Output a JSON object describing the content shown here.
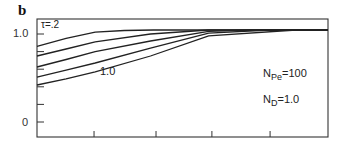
{
  "chart_data": {
    "type": "line",
    "panel_label": "b",
    "title": "",
    "xlabel": "",
    "ylabel": "",
    "ylim": [
      0,
      1.1
    ],
    "xlim": [
      0,
      1
    ],
    "y_ticks": [
      {
        "value": 1.0,
        "label": "1.0"
      },
      {
        "value": 0.8,
        "label": ""
      },
      {
        "value": 0.6,
        "label": ""
      },
      {
        "value": 0.4,
        "label": ""
      },
      {
        "value": 0.2,
        "label": ""
      },
      {
        "value": 0.0,
        "label": "0"
      }
    ],
    "x_ticks": [
      0.196,
      0.409,
      0.601,
      0.801
    ],
    "grid": false,
    "plateau_value": 1.045,
    "series": [
      {
        "name": "τ=.2",
        "x": [
          0,
          0.1,
          0.2,
          0.3,
          0.4,
          1.0
        ],
        "y": [
          0.86,
          0.95,
          1.02,
          1.04,
          1.045,
          1.045
        ]
      },
      {
        "name": "τ (2)",
        "x": [
          0,
          0.1,
          0.2,
          0.39,
          0.59,
          1.0
        ],
        "y": [
          0.75,
          0.83,
          0.91,
          1.0,
          1.045,
          1.045
        ]
      },
      {
        "name": "τ (3)",
        "x": [
          0,
          0.1,
          0.2,
          0.39,
          0.59,
          0.73,
          1.0
        ],
        "y": [
          0.625,
          0.71,
          0.8,
          0.92,
          1.03,
          1.045,
          1.045
        ]
      },
      {
        "name": "τ (4)",
        "x": [
          0,
          0.1,
          0.2,
          0.39,
          0.59,
          0.8,
          1.0
        ],
        "y": [
          0.51,
          0.59,
          0.67,
          0.84,
          1.01,
          1.045,
          1.045
        ]
      },
      {
        "name": "τ=1.0",
        "x": [
          0,
          0.1,
          0.2,
          0.39,
          0.59,
          0.89,
          1.0
        ],
        "y": [
          0.42,
          0.49,
          0.57,
          0.75,
          0.98,
          1.045,
          1.045
        ]
      }
    ],
    "annotations": [
      {
        "text": "τ=.2",
        "x": 40,
        "y": 20
      },
      {
        "text": "1.0",
        "x": 100,
        "y": 66
      },
      {
        "main": "N",
        "sub": "Pe",
        "rest": "=100",
        "x": 263,
        "y": 69
      },
      {
        "main": "N",
        "sub": "D",
        "rest": "=1.0",
        "x": 263,
        "y": 95
      }
    ]
  },
  "labels": {
    "panel": "b",
    "y_top": "1.0",
    "y_zero": "0",
    "tau_top": "τ=.2",
    "tau_bottom": "1.0",
    "npe_main": "N",
    "npe_sub": "Pe",
    "npe_rest": "=100",
    "nd_main": "N",
    "nd_sub": "D",
    "nd_rest": "=1.0"
  }
}
